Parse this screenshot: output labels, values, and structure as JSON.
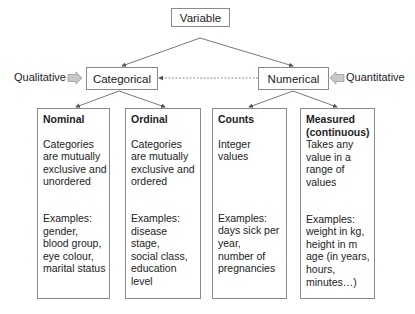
{
  "root": {
    "label": "Variable"
  },
  "level2": [
    {
      "label": "Categorical",
      "side_label": "Qualitative"
    },
    {
      "label": "Numerical",
      "side_label": "Quantitative"
    }
  ],
  "leaves": [
    {
      "title": "Nominal",
      "description": [
        "Categories",
        "are mutually",
        "exclusive and",
        "unordered"
      ],
      "examples": [
        "Examples:",
        "gender,",
        "blood group,",
        "eye colour,",
        "marital status"
      ]
    },
    {
      "title": "Ordinal",
      "description": [
        "Categories",
        "are mutually",
        "exclusive and",
        "ordered"
      ],
      "examples": [
        "Examples:",
        "disease",
        "stage,",
        "social class,",
        "education",
        "level"
      ]
    },
    {
      "title": "Counts",
      "description": [
        "Integer",
        "values"
      ],
      "examples": [
        "Examples:",
        "days sick per",
        "year,",
        "number of",
        "pregnancies"
      ]
    },
    {
      "title": "Measured",
      "title2": "(continuous)",
      "description": [
        "Takes any",
        "value in a",
        "range of",
        "values"
      ],
      "examples": [
        "Examples:",
        "weight in kg,",
        "height in m",
        "age (in years,",
        "hours,",
        "minutes…)"
      ]
    }
  ],
  "colors": {
    "border": "#8a8a8a",
    "arrow": "#555555",
    "side_arrow_fill": "#c8c8c8"
  }
}
